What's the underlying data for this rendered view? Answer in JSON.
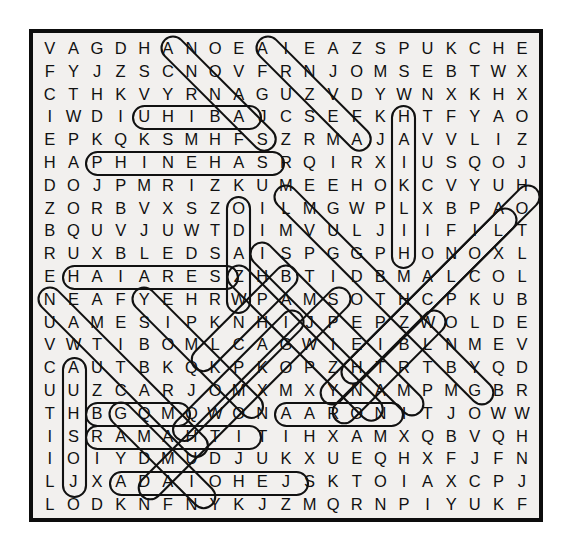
{
  "puzzle": {
    "type": "word-search",
    "rows": 21,
    "cols": 21,
    "background_color": "#f2f0ee",
    "border_color": "#0d0d0d",
    "letter_color": "#111111",
    "mark_color": "#111111",
    "grid": [
      [
        "V",
        "A",
        "G",
        "D",
        "H",
        "A",
        "N",
        "O",
        "E",
        "A",
        "I",
        "E",
        "A",
        "Z",
        "S",
        "P",
        "U",
        "K",
        "C",
        "H",
        "E"
      ],
      [
        "F",
        "Y",
        "J",
        "Z",
        "S",
        "C",
        "N",
        "O",
        "V",
        "F",
        "R",
        "N",
        "J",
        "O",
        "M",
        "S",
        "E",
        "B",
        "T",
        "W",
        "X"
      ],
      [
        "C",
        "T",
        "H",
        "K",
        "V",
        "Y",
        "R",
        "N",
        "A",
        "G",
        "U",
        "Z",
        "V",
        "D",
        "Y",
        "W",
        "N",
        "X",
        "K",
        "H",
        "X"
      ],
      [
        "I",
        "W",
        "D",
        "I",
        "U",
        "H",
        "I",
        "B",
        "A",
        "J",
        "C",
        "S",
        "E",
        "F",
        "K",
        "H",
        "T",
        "F",
        "Y",
        "A",
        "O"
      ],
      [
        "E",
        "P",
        "K",
        "Q",
        "K",
        "S",
        "M",
        "H",
        "F",
        "S",
        "Z",
        "R",
        "M",
        "A",
        "J",
        "A",
        "V",
        "V",
        "L",
        "I",
        "Z"
      ],
      [
        "H",
        "A",
        "P",
        "H",
        "I",
        "N",
        "E",
        "H",
        "A",
        "S",
        "R",
        "Q",
        "I",
        "R",
        "X",
        "I",
        "U",
        "S",
        "Q",
        "O",
        "J"
      ],
      [
        "D",
        "O",
        "J",
        "P",
        "M",
        "R",
        "I",
        "Z",
        "K",
        "U",
        "M",
        "E",
        "E",
        "H",
        "O",
        "K",
        "C",
        "V",
        "Y",
        "U",
        "H"
      ],
      [
        "Z",
        "O",
        "R",
        "B",
        "V",
        "X",
        "S",
        "Z",
        "O",
        "I",
        "L",
        "M",
        "G",
        "W",
        "P",
        "L",
        "X",
        "B",
        "P",
        "A",
        "O"
      ],
      [
        "B",
        "Q",
        "U",
        "V",
        "J",
        "U",
        "W",
        "T",
        "D",
        "I",
        "M",
        "V",
        "U",
        "L",
        "J",
        "I",
        "I",
        "F",
        "I",
        "L",
        "T"
      ],
      [
        "R",
        "U",
        "X",
        "B",
        "L",
        "E",
        "D",
        "S",
        "A",
        "I",
        "S",
        "P",
        "G",
        "G",
        "P",
        "H",
        "O",
        "N",
        "O",
        "X",
        "L"
      ],
      [
        "E",
        "H",
        "A",
        "I",
        "A",
        "R",
        "E",
        "S",
        "Z",
        "H",
        "B",
        "T",
        "I",
        "D",
        "B",
        "M",
        "A",
        "L",
        "C",
        "O",
        "L"
      ],
      [
        "N",
        "E",
        "A",
        "F",
        "Y",
        "E",
        "H",
        "R",
        "W",
        "P",
        "A",
        "M",
        "S",
        "O",
        "T",
        "H",
        "C",
        "P",
        "K",
        "U",
        "B"
      ],
      [
        "U",
        "A",
        "M",
        "E",
        "S",
        "I",
        "P",
        "K",
        "N",
        "H",
        "I",
        "J",
        "P",
        "E",
        "P",
        "Z",
        "W",
        "O",
        "L",
        "D",
        "E"
      ],
      [
        "V",
        "W",
        "T",
        "I",
        "B",
        "O",
        "M",
        "L",
        "C",
        "A",
        "G",
        "W",
        "I",
        "E",
        "I",
        "B",
        "L",
        "N",
        "M",
        "E",
        "V"
      ],
      [
        "C",
        "A",
        "U",
        "T",
        "B",
        "K",
        "Q",
        "K",
        "P",
        "K",
        "O",
        "P",
        "Z",
        "H",
        "T",
        "R",
        "T",
        "B",
        "Y",
        "Q",
        "D"
      ],
      [
        "U",
        "U",
        "Z",
        "C",
        "A",
        "R",
        "J",
        "O",
        "M",
        "X",
        "M",
        "X",
        "Y",
        "N",
        "A",
        "M",
        "P",
        "M",
        "G",
        "B",
        "R"
      ],
      [
        "T",
        "H",
        "B",
        "G",
        "Q",
        "M",
        "Q",
        "W",
        "O",
        "N",
        "A",
        "A",
        "R",
        "O",
        "N",
        "I",
        "T",
        "J",
        "O",
        "W",
        "W"
      ],
      [
        "I",
        "S",
        "R",
        "A",
        "M",
        "A",
        "H",
        "T",
        "I",
        "T",
        "I",
        "H",
        "X",
        "A",
        "M",
        "X",
        "Q",
        "B",
        "V",
        "Q",
        "H"
      ],
      [
        "I",
        "O",
        "I",
        "Y",
        "D",
        "M",
        "U",
        "D",
        "J",
        "U",
        "K",
        "X",
        "U",
        "E",
        "Q",
        "H",
        "X",
        "F",
        "J",
        "F",
        "N"
      ],
      [
        "L",
        "J",
        "X",
        "A",
        "D",
        "A",
        "I",
        "O",
        "H",
        "E",
        "J",
        "S",
        "K",
        "T",
        "O",
        "I",
        "A",
        "X",
        "C",
        "P",
        "J"
      ],
      [
        "L",
        "O",
        "D",
        "K",
        "N",
        "F",
        "N",
        "Y",
        "K",
        "J",
        "Z",
        "M",
        "Q",
        "R",
        "N",
        "P",
        "I",
        "Y",
        "U",
        "K",
        "F"
      ]
    ],
    "found_words": [
      {
        "word": "UHIBA",
        "row": 3,
        "col_start": 4,
        "col_end": 8,
        "direction": "horizontal"
      },
      {
        "word": "PHINEHAS",
        "row": 5,
        "col_start": 2,
        "col_end": 9,
        "direction": "horizontal"
      },
      {
        "word": "HAIARES",
        "row": 10,
        "col_start": 1,
        "col_end": 7,
        "direction": "horizontal"
      },
      {
        "word": "AARON",
        "row": 16,
        "col_start": 10,
        "col_end": 14,
        "direction": "horizontal"
      },
      {
        "word": "RAMAHTI",
        "row": 17,
        "col_start": 2,
        "col_end": 8,
        "direction": "horizontal"
      },
      {
        "word": "ADAIOHEJ",
        "row": 19,
        "col_start": 3,
        "col_end": 10,
        "direction": "horizontal"
      },
      {
        "word": "KOIDSAZH",
        "row_start": 6,
        "row_end": 10,
        "col": 8,
        "direction": "vertical"
      },
      {
        "word": "HAJILH",
        "row_start": 3,
        "row_end": 9,
        "col": 15,
        "direction": "vertical"
      },
      {
        "word": "AUUHSOJ",
        "row_start": 14,
        "row_end": 19,
        "col": 1,
        "direction": "vertical"
      },
      {
        "word": "ANOZSE",
        "row_start": 0,
        "row_end": 4,
        "col": 5,
        "direction": "diagonal-down-right"
      },
      {
        "word": "AIRNREH",
        "row_start": 0,
        "row_end": 5,
        "col": 9,
        "direction": "diagonal-down-right"
      },
      {
        "word": "HUEIZMA",
        "row_start": 6,
        "row_end": 15,
        "col": 20,
        "direction": "diagonal-down-left"
      },
      {
        "word": "NEAFYEH",
        "row_start": 11,
        "row_end": 16,
        "col": 0,
        "direction": "diagonal-down-right"
      },
      {
        "word": "BGQM",
        "row": 16,
        "col_start": 2,
        "col_end": 5,
        "direction": "horizontal"
      },
      {
        "word": "FNY",
        "row": 20,
        "col_start": 5,
        "col_end": 7,
        "direction": "diagonal"
      }
    ],
    "mark_shapes": [
      {
        "kind": "ellipse-horizontal",
        "name": "uhiba-oval"
      },
      {
        "kind": "ellipse-horizontal",
        "name": "phinehas-oval"
      },
      {
        "kind": "ellipse-horizontal",
        "name": "haiares-oval"
      },
      {
        "kind": "ellipse-horizontal",
        "name": "aaron-oval"
      },
      {
        "kind": "ellipse-horizontal",
        "name": "ramahti-oval"
      },
      {
        "kind": "ellipse-horizontal",
        "name": "adaiohej-oval"
      },
      {
        "kind": "capsule-vertical",
        "name": "koidsazh-capsule"
      },
      {
        "kind": "capsule-vertical",
        "name": "hajilh-capsule"
      },
      {
        "kind": "capsule-vertical",
        "name": "auuhsoj-capsule"
      },
      {
        "kind": "capsule-diagonal",
        "name": "diagonal-marks"
      }
    ]
  }
}
